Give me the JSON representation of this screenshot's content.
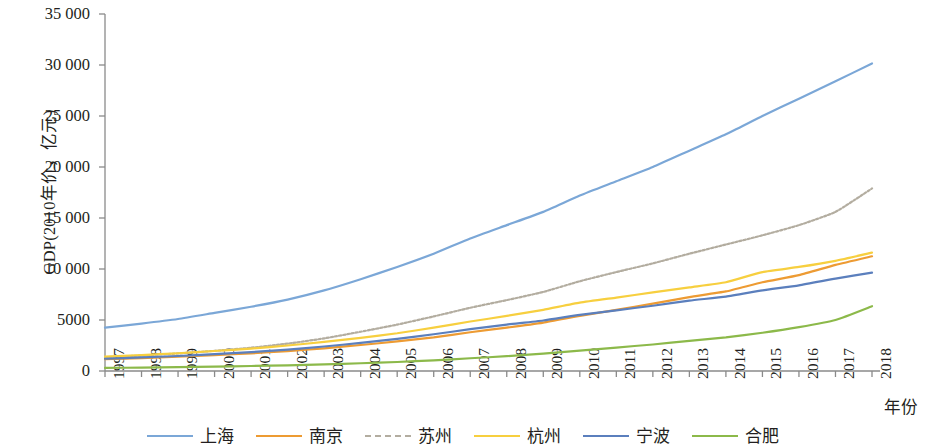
{
  "axes": {
    "y_title": "GDP(2010年价，亿元)",
    "x_title": "年份",
    "y_ticks": [
      "0",
      "5000",
      "10 000",
      "15 000",
      "20 000",
      "25 000",
      "30 000",
      "35 000"
    ],
    "x_ticks": [
      "1997",
      "1998",
      "1999",
      "2000",
      "2001",
      "2002",
      "2003",
      "2004",
      "2005",
      "2006",
      "2007",
      "2008",
      "2009",
      "2010",
      "2011",
      "2012",
      "2013",
      "2014",
      "2015",
      "2016",
      "2017",
      "2018"
    ]
  },
  "legend": {
    "items": [
      {
        "label": "上海",
        "color": "#7ba7d7"
      },
      {
        "label": "南京",
        "color": "#ed9b33"
      },
      {
        "label": "苏州",
        "color": "#b3ada0"
      },
      {
        "label": "杭州",
        "color": "#f7cf3f"
      },
      {
        "label": "宁波",
        "color": "#5b7fbd"
      },
      {
        "label": "合肥",
        "color": "#8cb94a"
      }
    ]
  },
  "chart_data": {
    "type": "line",
    "title": "",
    "xlabel": "年份",
    "ylabel": "GDP(2010年价，亿元)",
    "xlim": [
      1997,
      2018
    ],
    "ylim": [
      0,
      35000
    ],
    "ytick_step": 5000,
    "grid": false,
    "legend_position": "bottom",
    "x": [
      1997,
      1998,
      1999,
      2000,
      2001,
      2002,
      2003,
      2004,
      2005,
      2006,
      2007,
      2008,
      2009,
      2010,
      2011,
      2012,
      2013,
      2014,
      2015,
      2016,
      2017,
      2018
    ],
    "series": [
      {
        "name": "上海",
        "color": "#7ba7d7",
        "style": "solid",
        "values": [
          4250,
          4650,
          5100,
          5700,
          6300,
          7000,
          7900,
          9000,
          10200,
          11500,
          13000,
          14300,
          15600,
          17200,
          18600,
          20000,
          21600,
          23200,
          25000,
          26700,
          28400,
          30150
        ]
      },
      {
        "name": "南京",
        "color": "#ed9b33",
        "style": "solid",
        "values": [
          1150,
          1270,
          1400,
          1560,
          1730,
          1950,
          2220,
          2550,
          2900,
          3300,
          3800,
          4250,
          4750,
          5400,
          6000,
          6600,
          7250,
          7800,
          8700,
          9400,
          10400,
          11250
        ]
      },
      {
        "name": "苏州",
        "color": "#b3ada0",
        "style": "dotted",
        "values": [
          1350,
          1520,
          1720,
          1980,
          2280,
          2680,
          3200,
          3850,
          4550,
          5350,
          6200,
          6950,
          7750,
          8800,
          9700,
          10550,
          11500,
          12400,
          13300,
          14300,
          15600,
          17900
        ]
      },
      {
        "name": "杭州",
        "color": "#f7cf3f",
        "style": "solid",
        "values": [
          1400,
          1560,
          1740,
          1960,
          2200,
          2500,
          2850,
          3250,
          3700,
          4250,
          4850,
          5400,
          6000,
          6700,
          7200,
          7700,
          8200,
          8700,
          9700,
          10200,
          10800,
          11600
        ]
      },
      {
        "name": "宁波",
        "color": "#5b7fbd",
        "style": "solid",
        "values": [
          1200,
          1330,
          1470,
          1650,
          1850,
          2100,
          2400,
          2750,
          3150,
          3600,
          4100,
          4550,
          4950,
          5500,
          5950,
          6400,
          6900,
          7300,
          7900,
          8400,
          9050,
          9650
        ]
      },
      {
        "name": "合肥",
        "color": "#8cb94a",
        "style": "solid",
        "values": [
          300,
          340,
          380,
          430,
          490,
          560,
          650,
          760,
          880,
          1050,
          1250,
          1450,
          1700,
          2000,
          2300,
          2600,
          2950,
          3300,
          3750,
          4300,
          5000,
          6350
        ]
      }
    ]
  },
  "plot_geometry": {
    "left": 105,
    "right": 872,
    "top": 14,
    "bottom": 371
  }
}
